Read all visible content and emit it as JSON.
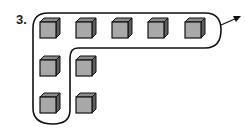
{
  "problem_number": "3.",
  "figure": {
    "circled_cube_count": 7,
    "extra_cube_count": 2,
    "total_cubes": 9,
    "colors": {
      "cube_front": "#a8a8a8",
      "cube_top": "#8a8a8a",
      "cube_side": "#5e5e5e",
      "outline": "#111111"
    }
  }
}
